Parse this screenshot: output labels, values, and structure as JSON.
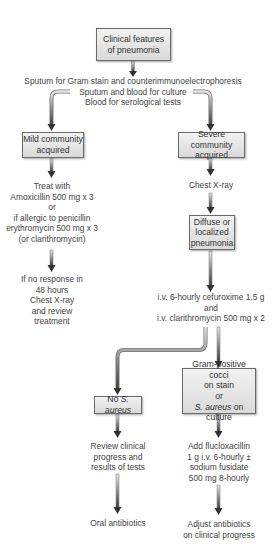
{
  "diagram": {
    "nodes": {
      "start": {
        "lines": [
          "Clinical features",
          "of pneumonia"
        ]
      },
      "tests": {
        "lines": [
          "Sputum for Gram stain and counterimmunoelectrophoresis",
          "Sputum and blood for culture",
          "Blood for serological tests"
        ]
      },
      "mild": {
        "lines": [
          "Mild community",
          "acquired"
        ]
      },
      "severe": {
        "lines": [
          "Severe community",
          "acquired"
        ]
      },
      "mild_treat": {
        "lines": [
          "Treat with",
          "Amoxicillin 500 mg x 3",
          "or",
          "if allergic to penicillin",
          "erythromycin 500 mg x 3",
          "(or clarithromycin)"
        ]
      },
      "mild_no_response": {
        "lines": [
          "If no response in",
          "48 hours",
          "Chest X-ray",
          "and review",
          "treatment"
        ]
      },
      "chest_xray": {
        "lines": [
          "Chest X-ray"
        ]
      },
      "diffuse": {
        "lines": [
          "Diffuse or",
          "localized",
          "pneumonia"
        ]
      },
      "iv_treatment": {
        "lines": [
          "i.v. 6-hourly cefuroxime 1.5 g",
          "and",
          "i.v. clarithromycin 500 mg x 2"
        ]
      },
      "no_saureus": {
        "prefix": "No ",
        "italic": "S. aureus"
      },
      "gram_positive": {
        "lines": [
          "Gram-positive cocci",
          "on stain",
          "or"
        ],
        "last_italic": "S. aureus",
        "last_rest": " on culture"
      },
      "review": {
        "lines": [
          "Review clinical",
          "progress and",
          "results of tests"
        ]
      },
      "fluclox": {
        "lines": [
          "Add flucloxacillin",
          "1 g i.v. 6-hourly ±",
          "sodium fusidate",
          "500 mg 8-hourly"
        ]
      },
      "oral": {
        "lines": [
          "Oral antibiotics"
        ]
      },
      "adjust": {
        "lines": [
          "Adjust antibiotics",
          "on clinical progress"
        ]
      }
    },
    "colors": {
      "box_fill_top": "#f2f2f2",
      "box_fill_bottom": "#dadada",
      "box_border": "#6a6a6a",
      "arrow_dark": "#3a3a3a",
      "arrow_light": "#d8d8d8",
      "text": "#444444"
    }
  }
}
